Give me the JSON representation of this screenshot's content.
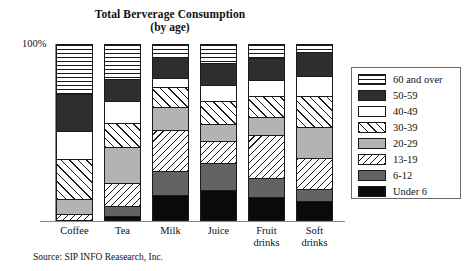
{
  "chart_data": {
    "type": "bar",
    "subtype": "stacked-percentage",
    "title": "Total Berverage Consumption",
    "subtitle": "(by age)",
    "xlabel": "",
    "ylabel": "",
    "ylim": [
      0,
      100
    ],
    "y_axis_top_label": "100%",
    "grid": false,
    "legend_position": "right",
    "categories": [
      "Coffee",
      "Tea",
      "Milk",
      "Juice",
      "Fruit drinks",
      "Soft drinks"
    ],
    "category_labels": [
      {
        "line1": "Coffee",
        "line2": ""
      },
      {
        "line1": "Tea",
        "line2": ""
      },
      {
        "line1": "Milk",
        "line2": ""
      },
      {
        "line1": "Juice",
        "line2": ""
      },
      {
        "line1": "Fruit",
        "line2": "drinks"
      },
      {
        "line1": "Soft",
        "line2": "drinks"
      }
    ],
    "series": [
      {
        "name": "60 and over",
        "pattern": "horizontal-lines",
        "values": [
          29,
          20,
          7,
          11,
          8,
          4
        ]
      },
      {
        "name": "50-59",
        "pattern": "dark-solid",
        "values": [
          21,
          13,
          12,
          12,
          12,
          14
        ]
      },
      {
        "name": "40-49",
        "pattern": "white-solid",
        "values": [
          16,
          12,
          5,
          9,
          9,
          11
        ]
      },
      {
        "name": "30-39",
        "pattern": "diagonal-right",
        "values": [
          23,
          14,
          11,
          13,
          12,
          18
        ]
      },
      {
        "name": "20-29",
        "pattern": "gray-solid",
        "values": [
          8,
          21,
          13,
          10,
          10,
          18
        ]
      },
      {
        "name": "13-19",
        "pattern": "diagonal-left",
        "values": [
          3,
          13,
          24,
          12,
          25,
          18
        ]
      },
      {
        "name": "6-12",
        "pattern": "dark-gray-solid",
        "values": [
          0,
          5,
          14,
          16,
          11,
          6
        ]
      },
      {
        "name": "Under 6",
        "pattern": "black-solid",
        "values": [
          0,
          2,
          14,
          17,
          13,
          11
        ]
      }
    ]
  },
  "legend": {
    "items": [
      {
        "label": "60 and over",
        "pattern": "horizontal-lines"
      },
      {
        "label": "50-59",
        "pattern": "dark-solid"
      },
      {
        "label": "40-49",
        "pattern": "white-solid"
      },
      {
        "label": "30-39",
        "pattern": "diagonal-right"
      },
      {
        "label": "20-29",
        "pattern": "gray-solid"
      },
      {
        "label": "13-19",
        "pattern": "diagonal-left"
      },
      {
        "label": "6-12",
        "pattern": "dark-gray-solid"
      },
      {
        "label": "Under 6",
        "pattern": "black-solid"
      }
    ]
  },
  "source": {
    "text": "Source: SIP INFO Reasearch, Inc."
  },
  "colors": {
    "axis": "#8a8a8a",
    "outline": "#1a1a1a",
    "dark": "#2e2e2e",
    "gray": "#b3b3b3",
    "dark_gray": "#636363",
    "black": "#0a0a0a",
    "white": "#ffffff",
    "background": "#ffffff"
  }
}
